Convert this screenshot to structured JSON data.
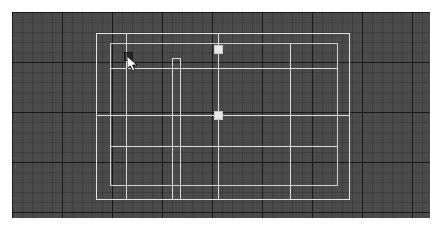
{
  "app": {
    "name": "floor-plan-editor",
    "view": "2D Plan",
    "canvas": {
      "x": 12,
      "y": 12,
      "width": 418,
      "height": 206,
      "background_color": "#4a4a4a",
      "grid_minor_spacing": 10,
      "grid_major_spacing": 50,
      "grid_minor_color": "#3e3e3e",
      "grid_major_color": "#313131",
      "grid_visible": true
    }
  },
  "page_background": "#ffffff",
  "colors": {
    "wall_stroke": "#dcdcdc",
    "wall_stroke_outer": "#e6e6e6",
    "wall_stroke_inner": "#d2d2d2",
    "handle_fill": "#e8e8e8",
    "handle_border": "#c8c8c8",
    "cursor_fill": "#ffffff",
    "cursor_stroke": "#141414"
  },
  "geometry": {
    "outer_rectangle": {
      "name": "exterior-wall-outline",
      "x": 96,
      "y": 33,
      "width": 254,
      "height": 167
    },
    "inner_rectangle": {
      "name": "interior-wall-outline",
      "x": 110,
      "y": 43,
      "width": 228,
      "height": 143
    },
    "horizontal_segments": [
      {
        "name": "wall-segment-h-upper",
        "x": 110,
        "y": 68,
        "length": 228
      },
      {
        "name": "wall-segment-h-mid",
        "x": 96,
        "y": 115,
        "length": 254
      },
      {
        "name": "wall-segment-h-lower",
        "x": 110,
        "y": 146,
        "length": 228
      },
      {
        "name": "wall-segment-h-stub",
        "x": 185,
        "y": 115,
        "length": 35
      }
    ],
    "vertical_segments": [
      {
        "name": "wall-segment-v-left",
        "x": 126,
        "y": 33,
        "length": 167
      },
      {
        "name": "wall-segment-v-center",
        "x": 218,
        "y": 33,
        "length": 167
      },
      {
        "name": "wall-segment-v-right",
        "x": 290,
        "y": 43,
        "length": 157
      },
      {
        "name": "wall-segment-v-door",
        "x": 172,
        "y": 58,
        "length": 142
      },
      {
        "name": "wall-segment-v-door2",
        "x": 180,
        "y": 58,
        "length": 142
      }
    ],
    "door_opening": {
      "name": "door-opening",
      "x": 172,
      "y": 58,
      "width": 9,
      "height": 3
    }
  },
  "selection": {
    "handles": [
      {
        "name": "selection-handle-top",
        "x": 214,
        "y": 45,
        "size": 9
      },
      {
        "name": "selection-handle-middle",
        "x": 214,
        "y": 111,
        "size": 9
      }
    ],
    "count": 2
  },
  "cursor": {
    "name": "mouse-pointer",
    "x": 127,
    "y": 55,
    "state": "snap-target",
    "snap_box": {
      "x": 124,
      "y": 52,
      "size": 9
    }
  },
  "axes": {
    "horizontal": [
      12,
      62,
      112,
      162,
      212
    ],
    "vertical": [
      12,
      62,
      112,
      162,
      212,
      262,
      312,
      362,
      412
    ]
  }
}
